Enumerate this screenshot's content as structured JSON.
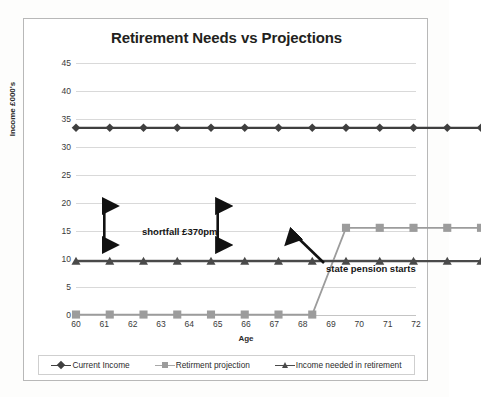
{
  "chart_data": {
    "type": "line",
    "title": "Retirement Needs vs Projections",
    "xlabel": "Age",
    "ylabel": "Income £000's",
    "x": [
      60,
      61,
      62,
      63,
      64,
      65,
      66,
      67,
      68,
      69,
      70,
      71,
      72
    ],
    "xticklabels": [
      "60",
      "61",
      "62",
      "63",
      "64",
      "65",
      "66",
      "67",
      "68",
      "69",
      "70",
      "71",
      "72"
    ],
    "yticklabels": [
      "0",
      "5",
      "10",
      "15",
      "20",
      "25",
      "30",
      "35",
      "40",
      "45"
    ],
    "yticks": [
      0,
      5,
      10,
      15,
      20,
      25,
      30,
      35,
      40,
      45
    ],
    "ylim": [
      0,
      45
    ],
    "xlim": [
      60,
      72
    ],
    "grid": "horizontal",
    "legend_position": "bottom",
    "series": [
      {
        "name": "Current Income",
        "marker": "diamond",
        "color": "#3f3f3f",
        "values": [
          40,
          40,
          40,
          40,
          40,
          40,
          40,
          40,
          40,
          40,
          40,
          40,
          40
        ]
      },
      {
        "name": "Retirment projection",
        "marker": "square",
        "color": "#9c9c9c",
        "values": [
          12,
          12,
          12,
          12,
          12,
          12,
          12,
          12,
          25,
          25,
          25,
          25,
          25
        ]
      },
      {
        "name": "Income needed in retirement",
        "marker": "triangle",
        "color": "#4a4a4a",
        "values": [
          20,
          20,
          20,
          20,
          20,
          20,
          20,
          20,
          20,
          20,
          20,
          20,
          20
        ]
      }
    ],
    "annotations": [
      {
        "id": "shortfall",
        "text": "shortfall £370pm",
        "kind": "double-arrow-pair",
        "from_value": 12,
        "to_value": 20,
        "at_x": [
          61,
          65
        ]
      },
      {
        "id": "state-pension",
        "text": "state pension starts",
        "kind": "arrow",
        "points_at_x": 67.6,
        "points_at_value": 18
      }
    ]
  },
  "colors": {
    "current_income": "#3f3f3f",
    "retirement_projection": "#9c9c9c",
    "income_needed": "#4a4a4a",
    "gridline": "#d9d9d9",
    "frame_border": "#b8b8b8",
    "text": "#231f20"
  }
}
